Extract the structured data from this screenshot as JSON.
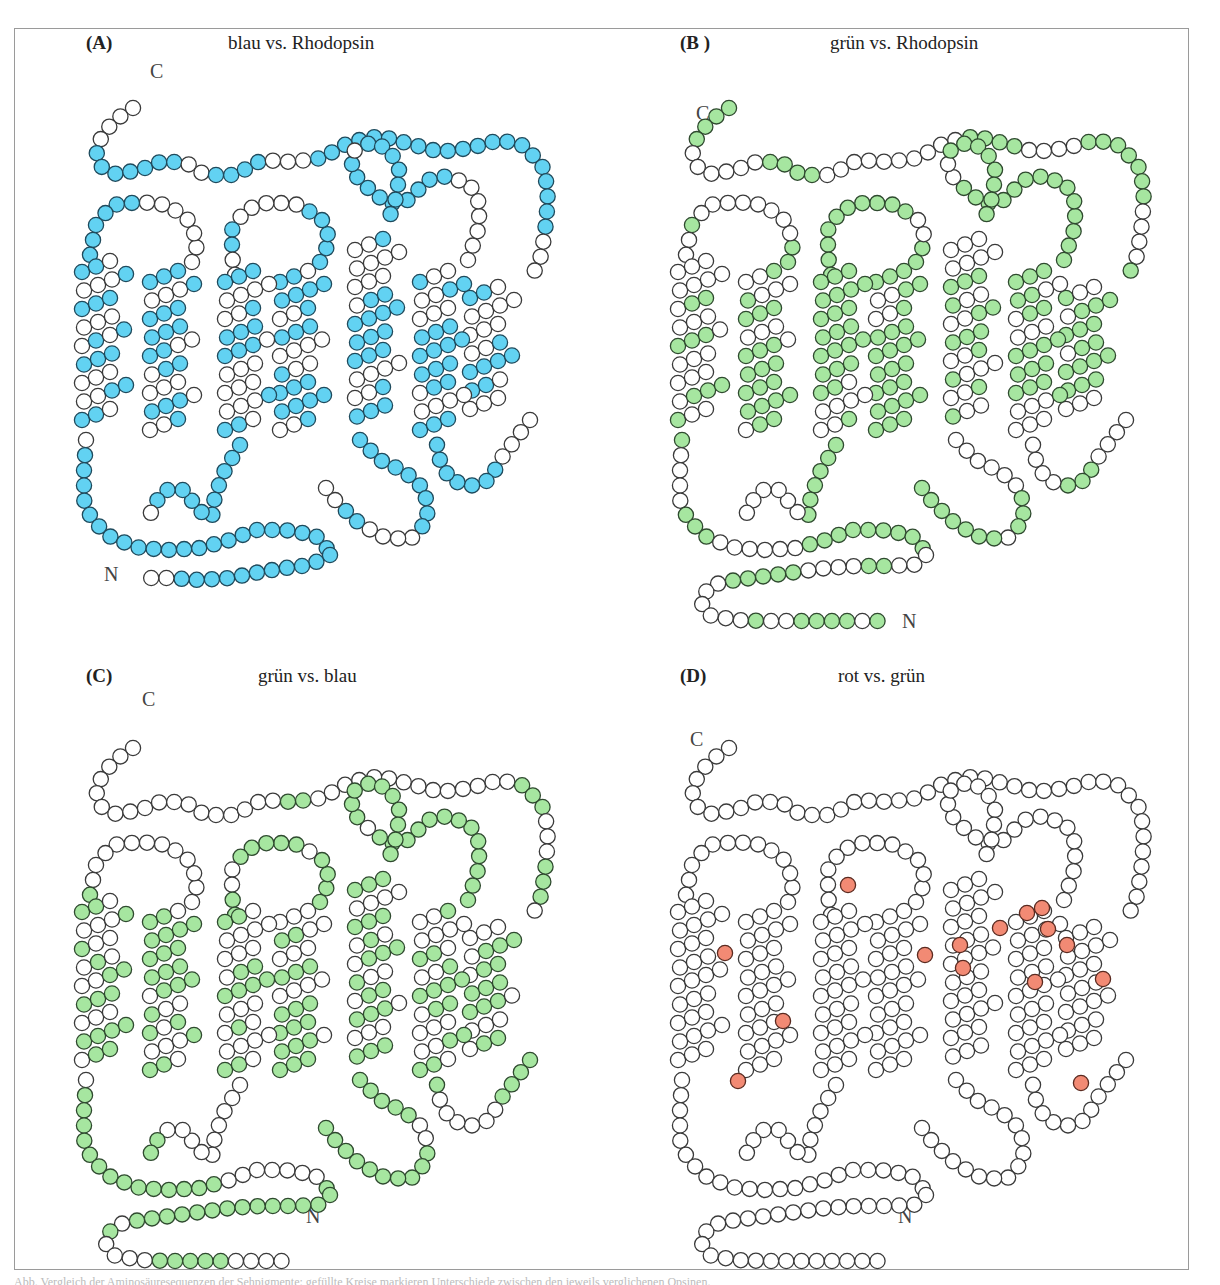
{
  "figure": {
    "colors": {
      "blau": "#62d2f2",
      "gruen": "#a6e6a0",
      "rot": "#f28a74",
      "empty": "#ffffff",
      "stroke": "#3a3a3a",
      "stroke_blau": "#1f4a5c",
      "stroke_gruen": "#2f4a2f"
    },
    "radius": 7.6,
    "panels": [
      {
        "id": "A",
        "label": "(A)",
        "title": "blau vs. Rhodopsin",
        "label_pos": [
          86,
          32
        ],
        "title_pos": [
          228,
          32
        ],
        "offset": [
          0,
          0
        ],
        "variant": "short_n",
        "fill": "blau",
        "c_label": [
          150,
          62
        ],
        "n_label": [
          104,
          565
        ],
        "density": 0.62,
        "seed": 11
      },
      {
        "id": "B",
        "label": "(B )",
        "title": "grün vs. Rhodopsin",
        "label_pos": [
          680,
          32
        ],
        "title_pos": [
          830,
          32
        ],
        "offset": [
          596,
          0
        ],
        "variant": "long_n",
        "fill": "gruen",
        "c_label": [
          696,
          104
        ],
        "n_label": [
          902,
          612
        ],
        "density": 0.58,
        "seed": 23
      },
      {
        "id": "C",
        "label": "(C)",
        "title": "grün vs. blau",
        "label_pos": [
          86,
          665
        ],
        "title_pos": [
          258,
          665
        ],
        "offset": [
          0,
          640
        ],
        "variant": "long_n_c",
        "fill": "gruen",
        "c_label": [
          142,
          690
        ],
        "n_label": [
          306,
          1207
        ],
        "density": 0.55,
        "seed": 37
      },
      {
        "id": "D",
        "label": "(D)",
        "title": "rot vs. grün",
        "label_pos": [
          680,
          665
        ],
        "title_pos": [
          838,
          665
        ],
        "offset": [
          596,
          640
        ],
        "variant": "long_n",
        "fill": "none",
        "c_label": [
          690,
          730
        ],
        "n_label": [
          898,
          1207
        ],
        "density": 0,
        "seed": 5,
        "highlight_points": [
          [
            848,
            885
          ],
          [
            725,
            953
          ],
          [
            783,
            1021
          ],
          [
            738,
            1081
          ],
          [
            925,
            955
          ],
          [
            960,
            945
          ],
          [
            963,
            968
          ],
          [
            1000,
            928
          ],
          [
            1027,
            913
          ],
          [
            1042,
            908
          ],
          [
            1048,
            929
          ],
          [
            1067,
            945
          ],
          [
            1035,
            982
          ],
          [
            1103,
            979
          ],
          [
            1081,
            1083
          ]
        ],
        "highlight_fill": "rot"
      }
    ],
    "terminus_labels": {
      "c": "C",
      "n": "N"
    },
    "caption": "Abb. Vergleich der Aminosäuresequenzen der Sehpigmente: gefüllte Kreise markieren Unterschiede zwischen den jeweils verglichenen Opsinen."
  }
}
